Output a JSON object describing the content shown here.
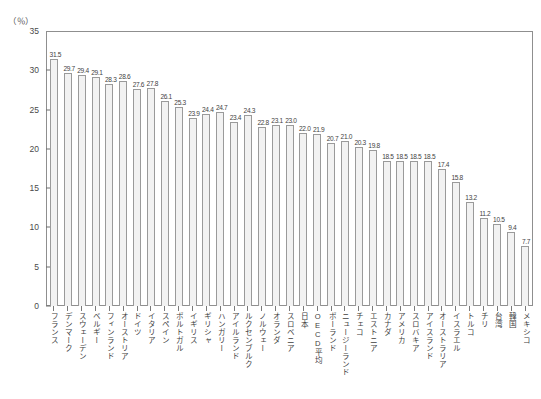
{
  "chart_data": {
    "type": "bar",
    "title": "",
    "subtitle": "",
    "xlabel": "",
    "ylabel": "",
    "unit_label": "（％）",
    "ylim": [
      0,
      35
    ],
    "yticks": [
      0,
      5,
      10,
      15,
      20,
      25,
      30,
      35
    ],
    "grid": false,
    "legend": "none",
    "categories": [
      "フランス",
      "デンマーク",
      "スウェーデン",
      "ベルギー",
      "フィンランド",
      "オーストリア",
      "ドイツ",
      "イタリア",
      "スペイン",
      "ポルトガル",
      "イギリス",
      "ギリシャ",
      "ハンガリー",
      "アイルランド",
      "ルクセンブルク",
      "ノルウェー",
      "オランダ",
      "スロベニア",
      "日本",
      "OECD平均",
      "ポーランド",
      "ニュージーランド",
      "チェコ",
      "エストニア",
      "カナダ",
      "アメリカ",
      "スロバキア",
      "アイスランド",
      "オーストラリア",
      "イスラエル",
      "トルコ",
      "チリ",
      "台湾",
      "韓国",
      "メキシコ"
    ],
    "values": [
      31.5,
      29.7,
      29.4,
      29.1,
      28.3,
      28.6,
      27.6,
      27.8,
      26.1,
      25.3,
      23.9,
      24.4,
      24.7,
      23.4,
      24.3,
      22.8,
      23.1,
      23.0,
      22.0,
      21.9,
      20.7,
      21.0,
      20.3,
      19.8,
      18.5,
      18.5,
      18.5,
      18.5,
      17.4,
      15.8,
      13.2,
      11.2,
      10.5,
      9.4,
      7.7
    ],
    "value_labels": [
      "31.5",
      "29.7",
      "29.4",
      "29.1",
      "28.3",
      "28.6",
      "27.6",
      "27.8",
      "26.1",
      "25.3",
      "23.9",
      "24.4",
      "24.7",
      "23.4",
      "24.3",
      "22.8",
      "23.1",
      "23.0",
      "22.0",
      "21.9",
      "20.7",
      "21.0",
      "20.3",
      "19.8",
      "18.5",
      "18.5",
      "18.5",
      "18.5",
      "17.4",
      "15.8",
      "13.2",
      "11.2",
      "10.5",
      "9.4",
      "7.7"
    ],
    "bar_fill_color": "#f2f2f2",
    "bar_border_color": "#9a9a9a",
    "axis_color": "#8f8f8f",
    "text_color": "#3f3f3f"
  }
}
